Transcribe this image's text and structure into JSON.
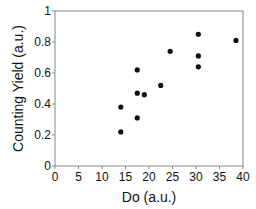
{
  "chart_data": {
    "type": "scatter",
    "title": "",
    "xlabel": "Do (a.u.)",
    "ylabel": "Counting Yield (a.u.)",
    "xlim": [
      0,
      40
    ],
    "ylim": [
      0,
      1
    ],
    "x_ticks": [
      "0",
      "5",
      "10",
      "15",
      "20",
      "25",
      "30",
      "35",
      "40"
    ],
    "y_ticks": [
      "0",
      "0.2",
      "0.4",
      "0.6",
      "0.8",
      "1"
    ],
    "grid": false,
    "legend": null,
    "series": [
      {
        "name": "data",
        "marker": "filled-circle",
        "color": "#111111",
        "points": [
          {
            "x": 14.0,
            "y": 0.38
          },
          {
            "x": 14.0,
            "y": 0.22
          },
          {
            "x": 17.5,
            "y": 0.62
          },
          {
            "x": 17.5,
            "y": 0.47
          },
          {
            "x": 17.5,
            "y": 0.31
          },
          {
            "x": 19.0,
            "y": 0.46
          },
          {
            "x": 22.5,
            "y": 0.52
          },
          {
            "x": 24.5,
            "y": 0.74
          },
          {
            "x": 30.5,
            "y": 0.85
          },
          {
            "x": 30.5,
            "y": 0.71
          },
          {
            "x": 30.5,
            "y": 0.64
          },
          {
            "x": 38.5,
            "y": 0.81
          }
        ]
      }
    ]
  },
  "plot": {
    "left": 55,
    "right": 243,
    "top": 11,
    "bottom": 166,
    "axis_color": "#888888",
    "point_radius": 2.6
  }
}
